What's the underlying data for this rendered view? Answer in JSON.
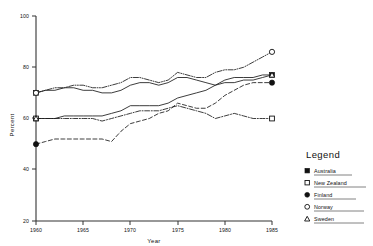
{
  "chart_data": {
    "type": "line",
    "title": "",
    "xlabel": "Year",
    "ylabel": "Percent",
    "xlim": [
      1960,
      1985
    ],
    "ylim": [
      20,
      100
    ],
    "grid": false,
    "xticks": [
      1960,
      1965,
      1970,
      1975,
      1980,
      1985
    ],
    "xtick_labels": [
      "1960",
      "1965",
      "1970",
      "1975",
      "1980",
      "1985"
    ],
    "yticks": [
      20,
      40,
      60,
      80,
      100
    ],
    "ytick_labels": [
      "20",
      "40",
      "60",
      "80",
      "100"
    ],
    "legend_position": "right",
    "x": [
      1960,
      1961,
      1962,
      1963,
      1964,
      1965,
      1966,
      1967,
      1968,
      1969,
      1970,
      1971,
      1972,
      1973,
      1974,
      1975,
      1976,
      1977,
      1978,
      1979,
      1980,
      1981,
      1982,
      1983,
      1984,
      1985
    ],
    "series": [
      {
        "name": "Australia",
        "marker": "filled-square",
        "linestyle": "solid",
        "values": [
          70,
          71,
          71,
          72,
          72,
          71,
          71,
          70,
          70,
          71,
          73,
          74,
          74,
          73,
          74,
          76,
          76,
          75,
          74,
          73,
          75,
          76,
          76,
          76,
          77,
          77
        ]
      },
      {
        "name": "New Zealand",
        "marker": "open-square",
        "linestyle": "dash-dot",
        "values": [
          60,
          60,
          60,
          60,
          60,
          60,
          60,
          59,
          60,
          61,
          62,
          63,
          63,
          63,
          64,
          65,
          64,
          63,
          62,
          60,
          61,
          62,
          61,
          60,
          60,
          60
        ]
      },
      {
        "name": "Finland",
        "marker": "filled-circle",
        "linestyle": "dashed",
        "values": [
          50,
          51,
          52,
          52,
          52,
          52,
          52,
          52,
          51,
          55,
          58,
          59,
          60,
          62,
          63,
          66,
          65,
          64,
          64,
          66,
          69,
          71,
          73,
          74,
          74,
          74
        ]
      },
      {
        "name": "Norway",
        "marker": "open-circle",
        "linestyle": "dash-dot-dot",
        "values": [
          70,
          71,
          72,
          72,
          73,
          73,
          72,
          72,
          73,
          74,
          76,
          76,
          75,
          74,
          75,
          78,
          77,
          76,
          76,
          78,
          79,
          79,
          80,
          82,
          84,
          86
        ]
      },
      {
        "name": "Sweden",
        "marker": "triangle",
        "linestyle": "solid",
        "values": [
          60,
          60,
          60,
          61,
          61,
          61,
          61,
          61,
          62,
          63,
          65,
          65,
          65,
          65,
          66,
          68,
          69,
          70,
          71,
          73,
          74,
          74,
          75,
          75,
          76,
          77
        ]
      }
    ]
  },
  "axes": {
    "ylabel": "Percent",
    "xlabel": "Year",
    "ytick_labels": [
      "100",
      "80",
      "60",
      "40",
      "20"
    ],
    "xtick_labels": [
      "1960",
      "1965",
      "1970",
      "1975",
      "1980",
      "1985"
    ]
  },
  "legend": {
    "title": "Legend",
    "items": [
      {
        "label": "Australia",
        "marker": "filled-square"
      },
      {
        "label": "New Zealand",
        "marker": "open-square"
      },
      {
        "label": "Finland",
        "marker": "filled-circle"
      },
      {
        "label": "Norway",
        "marker": "open-circle"
      },
      {
        "label": "Sweden",
        "marker": "triangle"
      }
    ]
  },
  "colors": {
    "ink": "#111111",
    "axis": "#333333",
    "background": "#ffffff"
  }
}
